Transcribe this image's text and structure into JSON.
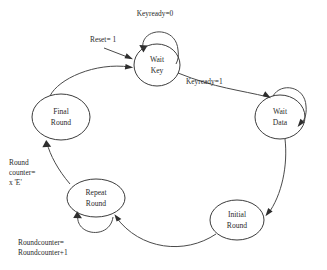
{
  "diagram": {
    "type": "state-machine",
    "title": "",
    "background_color": "#ffffff",
    "stroke_color": "#3c3c3c",
    "text_color": "#2b2b2b",
    "states": [
      {
        "id": "wait-key",
        "line1": "Wait",
        "line2": "Key",
        "cx": 157,
        "cy": 65,
        "rx": 23,
        "ry": 21
      },
      {
        "id": "wait-data",
        "line1": "Wait",
        "line2": "Data",
        "cx": 280,
        "cy": 117,
        "rx": 25,
        "ry": 22
      },
      {
        "id": "initial-round",
        "line1": "Initial",
        "line2": "Round",
        "cx": 237,
        "cy": 220,
        "rx": 27,
        "ry": 20
      },
      {
        "id": "repeat-round",
        "line1": "Repeat",
        "line2": "Round",
        "cx": 96,
        "cy": 198,
        "rx": 29,
        "ry": 19
      },
      {
        "id": "final-round",
        "line1": "Final",
        "line2": "Round",
        "cx": 61,
        "cy": 117,
        "rx": 29,
        "ry": 23
      }
    ],
    "transitions": [
      {
        "id": "reset-to-wait-key",
        "label": "Reset= 1",
        "from": "external",
        "to": "wait-key",
        "label_x": 90,
        "label_y": 40
      },
      {
        "id": "wait-key-self-loop",
        "label": "Keyready=0",
        "from": "wait-key",
        "to": "wait-key",
        "label_x": 155,
        "label_y": 14
      },
      {
        "id": "wait-key-to-wait-data",
        "label": "Keyready=1",
        "from": "wait-key",
        "to": "wait-data",
        "label_x": 215,
        "label_y": 82
      },
      {
        "id": "wait-data-self-loop",
        "label": "",
        "from": "wait-data",
        "to": "wait-data",
        "label_x": 0,
        "label_y": 0
      },
      {
        "id": "wait-data-to-initial-round",
        "label": "",
        "from": "wait-data",
        "to": "initial-round",
        "label_x": 0,
        "label_y": 0
      },
      {
        "id": "initial-round-to-repeat-round",
        "label": "",
        "from": "initial-round",
        "to": "repeat-round",
        "label_x": 0,
        "label_y": 0
      },
      {
        "id": "repeat-round-self-loop",
        "label_line1": "Roundcounter=",
        "label_line2": "Roundcounter+1",
        "from": "repeat-round",
        "to": "repeat-round",
        "label_x": 18,
        "label_y": 243
      },
      {
        "id": "repeat-round-to-final-round",
        "label_line1": "Round",
        "label_line2": "counter=",
        "label_line3": "x  'E'",
        "from": "repeat-round",
        "to": "final-round",
        "label_x": 9,
        "label_y": 163
      },
      {
        "id": "final-round-to-wait-key",
        "label": "",
        "from": "final-round",
        "to": "wait-key",
        "label_x": 0,
        "label_y": 0
      }
    ]
  }
}
